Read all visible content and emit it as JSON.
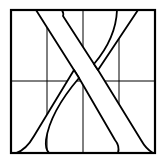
{
  "diagram": {
    "letter": "X",
    "colors": {
      "stroke": "#000000",
      "background": "#ffffff"
    },
    "frame": {
      "x": 11,
      "y": 10,
      "width": 144,
      "height": 143
    },
    "grid": {
      "vertical_lines_x": [
        47,
        83,
        119
      ],
      "horizontal_lines_y": [
        81
      ]
    }
  }
}
